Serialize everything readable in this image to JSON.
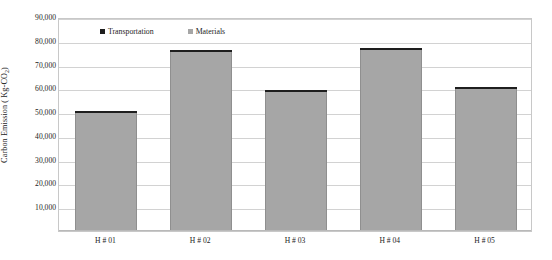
{
  "chart_data": {
    "type": "bar",
    "title": "",
    "subtitle": "",
    "xlabel": "",
    "ylabel": "Carbon Emission ( Kg-CO",
    "ylabel_sub": "2",
    "ylabel_suffix": ")",
    "categories": [
      "H # 01",
      "H # 02",
      "H # 03",
      "H # 04",
      "H # 05"
    ],
    "series": [
      {
        "name": "Materials",
        "color": "#a6a6a6",
        "values": [
          49600,
          75200,
          58400,
          76200,
          59900
        ]
      },
      {
        "name": "Transportation",
        "color": "#1e1e1e",
        "values": [
          700,
          800,
          700,
          900,
          800
        ]
      }
    ],
    "totals": [
      50300,
      76000,
      59100,
      77100,
      60700
    ],
    "stacked": true,
    "ylim": [
      0,
      90000
    ],
    "ytick_values": [
      90000,
      80000,
      70000,
      60000,
      50000,
      40000,
      30000,
      20000,
      10000
    ],
    "ytick_labels": [
      "90,000",
      "80,000",
      "70,000",
      "60,000",
      "50,000",
      "40,000",
      "30,000",
      "20,000",
      "10,000"
    ],
    "grid": true,
    "grid_axis": "y",
    "legend_position": "top-center",
    "legend": [
      {
        "label": "Transportation",
        "swatch": "transportation"
      },
      {
        "label": "Materials",
        "swatch": "materials"
      }
    ]
  }
}
